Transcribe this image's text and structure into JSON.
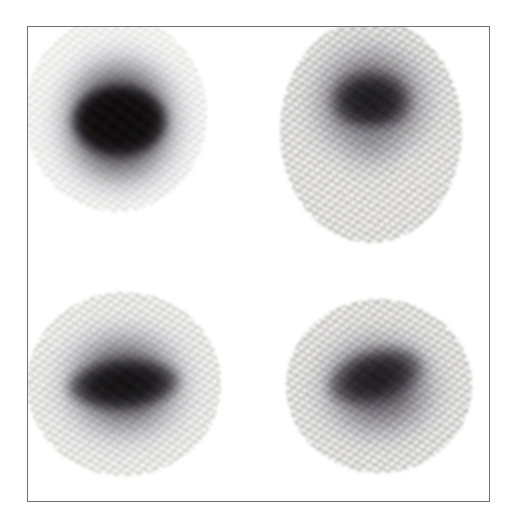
{
  "figure": {
    "kind": "scanned-grayscale-plate",
    "caption": "",
    "width_px": 506,
    "height_px": 523,
    "background_color": "#ffffff",
    "frame": {
      "name": "plate-border",
      "color": "#6d7073",
      "border_width_px": 1,
      "left_px": 27,
      "top_px": 26,
      "width_px": 463,
      "height_px": 476,
      "interior_color": "#fefefe"
    },
    "layout": {
      "arrangement": "2x2 grid",
      "rows": 2,
      "columns": 2,
      "labels_visible": false,
      "axis_visible": false,
      "scale_bar_visible": false
    }
  },
  "chart_data": {
    "type": "heatmap",
    "title": "",
    "subtitle": "",
    "xlabel": "",
    "ylabel": "",
    "grid": false,
    "legend": "none",
    "colormap": "grayscale-inverted",
    "panels": [
      {
        "id": "top-left",
        "row": 1,
        "column": 1,
        "center_x_px": 115,
        "center_y_px": 113,
        "width_px": 168,
        "height_px": 182,
        "core_darkness": 0.97,
        "halo_spread": 0.55,
        "shape": "round",
        "core_shape": "ellipse-horizontal",
        "mottling": "low",
        "tail": "none",
        "peak_hex": "#060608"
      },
      {
        "id": "top-right",
        "row": 1,
        "column": 2,
        "center_x_px": 370,
        "center_y_px": 130,
        "width_px": 168,
        "height_px": 208,
        "core_darkness": 0.82,
        "halo_spread": 0.7,
        "shape": "teardrop",
        "core_shape": "irregular-mottled",
        "mottling": "high",
        "tail": "downward-taper",
        "peak_hex": "#0a0a0e"
      },
      {
        "id": "bottom-left",
        "row": 2,
        "column": 1,
        "center_x_px": 123,
        "center_y_px": 383,
        "width_px": 180,
        "height_px": 170,
        "core_darkness": 0.92,
        "halo_spread": 0.6,
        "shape": "wide-oval",
        "core_shape": "ellipse-horizontal-tilted",
        "mottling": "medium",
        "tail": "none",
        "peak_hex": "#08080b"
      },
      {
        "id": "bottom-right",
        "row": 2,
        "column": 2,
        "center_x_px": 378,
        "center_y_px": 385,
        "width_px": 172,
        "height_px": 162,
        "core_darkness": 0.86,
        "halo_spread": 0.62,
        "shape": "oval",
        "core_shape": "ellipse-diagonal",
        "mottling": "high",
        "tail": "none",
        "peak_hex": "#0c0c10"
      }
    ]
  }
}
